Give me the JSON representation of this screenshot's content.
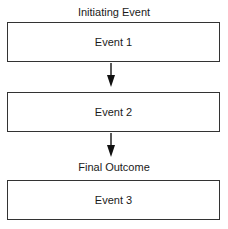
{
  "diagram": {
    "type": "flowchart",
    "direction": "top-to-bottom",
    "top_label": "Initiating  Event",
    "bottom_label": "Final Outcome",
    "nodes": [
      {
        "id": "event1",
        "label": "Event 1"
      },
      {
        "id": "event2",
        "label": "Event 2"
      },
      {
        "id": "event3",
        "label": "Event 3"
      }
    ],
    "edges": [
      {
        "from": "event1",
        "to": "event2"
      },
      {
        "from": "event2",
        "to": "event3"
      }
    ],
    "colors": {
      "stroke": "#333333",
      "text": "#1a1a1a",
      "background": "#ffffff"
    }
  }
}
